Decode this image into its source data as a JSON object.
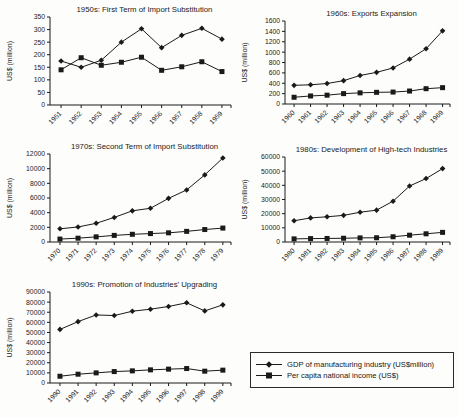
{
  "page": {
    "background": "#fdfdfc",
    "ink": "#1a1a1a"
  },
  "legend": {
    "items": [
      {
        "label": "GDP of manufacturing industry (US$million)",
        "marker": "diamond"
      },
      {
        "label": "Per capita national income (US$)",
        "marker": "square"
      }
    ]
  },
  "chart_data": [
    {
      "id": "1950s",
      "type": "line",
      "title": "1950s: First Term of Import Substitution",
      "ylabel": "US$ (million)",
      "xlabel": "",
      "categories": [
        "1951",
        "1952",
        "1953",
        "1954",
        "1955",
        "1956",
        "1957",
        "1958",
        "1959"
      ],
      "ylim": [
        0,
        350
      ],
      "ytick": 50,
      "grid": false,
      "legend_position": "none",
      "series": [
        {
          "name": "GDP of manufacturing industry (US$million)",
          "marker": "diamond",
          "values": [
            175,
            150,
            178,
            250,
            303,
            228,
            277,
            305,
            262
          ]
        },
        {
          "name": "Per capita national income (US$)",
          "marker": "square",
          "values": [
            140,
            188,
            158,
            170,
            190,
            138,
            152,
            172,
            133
          ]
        }
      ]
    },
    {
      "id": "1960s",
      "type": "line",
      "title": "1960s: Exports Expansion",
      "ylabel": "US$ (million)",
      "xlabel": "",
      "categories": [
        "1960",
        "1961",
        "1962",
        "1963",
        "1964",
        "1965",
        "1966",
        "1967",
        "1968",
        "1969"
      ],
      "ylim": [
        0,
        1600
      ],
      "ytick": 200,
      "grid": false,
      "legend_position": "none",
      "series": [
        {
          "name": "GDP of manufacturing industry (US$million)",
          "marker": "diamond",
          "values": [
            360,
            370,
            395,
            450,
            550,
            610,
            695,
            865,
            1065,
            1410
          ]
        },
        {
          "name": "Per capita national income (US$)",
          "marker": "square",
          "values": [
            130,
            155,
            170,
            200,
            215,
            225,
            230,
            250,
            295,
            315
          ]
        }
      ]
    },
    {
      "id": "1970s",
      "type": "line",
      "title": "1970s: Second Term of Import Substitution",
      "ylabel": "US$ (million)",
      "xlabel": "",
      "categories": [
        "1970",
        "1971",
        "1972",
        "1973",
        "1974",
        "1975",
        "1976",
        "1977",
        "1978",
        "1979"
      ],
      "ylim": [
        0,
        12000
      ],
      "ytick": 2000,
      "grid": false,
      "legend_position": "none",
      "series": [
        {
          "name": "GDP of manufacturing industry (US$million)",
          "marker": "diamond",
          "values": [
            1800,
            2050,
            2550,
            3350,
            4250,
            4600,
            5950,
            7100,
            9150,
            11450
          ]
        },
        {
          "name": "Per capita national income (US$)",
          "marker": "square",
          "values": [
            400,
            520,
            700,
            900,
            1050,
            1150,
            1250,
            1450,
            1700,
            1900
          ]
        }
      ]
    },
    {
      "id": "1980s",
      "type": "line",
      "title": "1980s: Development of High-tech Industries",
      "ylabel": "US$ (million)",
      "xlabel": "",
      "categories": [
        "1980",
        "1981",
        "1982",
        "1983",
        "1984",
        "1985",
        "1986",
        "1987",
        "1988",
        "1989"
      ],
      "ylim": [
        0,
        60000
      ],
      "ytick": 10000,
      "grid": false,
      "legend_position": "none",
      "series": [
        {
          "name": "GDP of manufacturing industry (US$million)",
          "marker": "diamond",
          "values": [
            15000,
            17000,
            17800,
            18800,
            21000,
            22500,
            28800,
            39500,
            44800,
            51800
          ]
        },
        {
          "name": "Per capita national income (US$)",
          "marker": "square",
          "values": [
            2200,
            2400,
            2500,
            2650,
            2900,
            3000,
            3700,
            4800,
            5800,
            6800
          ]
        }
      ]
    },
    {
      "id": "1990s",
      "type": "line",
      "title": "1990s: Promotion of Industries’ Upgrading",
      "ylabel": "US$ (million)",
      "xlabel": "",
      "categories": [
        "1990",
        "1991",
        "1992",
        "1993",
        "1994",
        "1995",
        "1996",
        "1997",
        "1998",
        "1999"
      ],
      "ylim": [
        0,
        90000
      ],
      "ytick": 10000,
      "grid": false,
      "legend_position": "none",
      "series": [
        {
          "name": "GDP of manufacturing industry (US$million)",
          "marker": "diamond",
          "values": [
            53000,
            60700,
            67300,
            66700,
            71000,
            73000,
            75700,
            79300,
            71300,
            77300
          ]
        },
        {
          "name": "Per capita national income (US$)",
          "marker": "square",
          "values": [
            6700,
            8700,
            10000,
            11300,
            12000,
            13000,
            13700,
            14300,
            11700,
            12700
          ]
        }
      ]
    }
  ]
}
